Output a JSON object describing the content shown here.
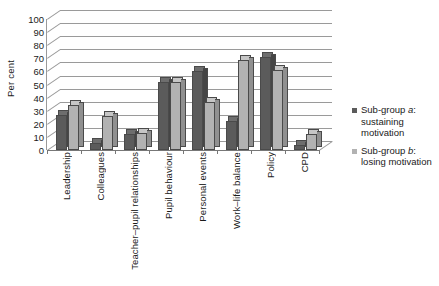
{
  "chart_data": {
    "type": "bar",
    "title": "",
    "xlabel": "",
    "ylabel": "Per cent",
    "ylim": [
      0,
      100
    ],
    "ytick_step": 10,
    "yticks": [
      100,
      90,
      80,
      70,
      60,
      50,
      40,
      30,
      20,
      10,
      0
    ],
    "grid": true,
    "legend_position": "right",
    "style": "3d-perspective-grouped-bars",
    "categories": [
      "Leadership",
      "Colleagues",
      "Teacher–pupil relationships",
      "Pupil behaviour",
      "Personal events",
      "Work–life balance",
      "Policy",
      "CPD"
    ],
    "series": [
      {
        "name": "Sub-group a: sustaining motivation",
        "short_name": "Sub-group a",
        "color": "#5b5b5b",
        "values": [
          27,
          5,
          12,
          52,
          60,
          22,
          71,
          4
        ]
      },
      {
        "name": "Sub-group b: losing motivation",
        "short_name": "Sub-group b",
        "color": "#b2b2b2",
        "values": [
          34,
          26,
          13,
          52,
          37,
          69,
          61,
          12
        ]
      }
    ]
  },
  "legend": {
    "entries": [
      {
        "label_line1_prefix": "Sub-group ",
        "label_line1_italic": "a",
        "label_line1_suffix": ":",
        "label_rest": "sustaining motivation",
        "swatch_color": "#5b5b5b"
      },
      {
        "label_line1_prefix": "Sub-group ",
        "label_line1_italic": "b",
        "label_line1_suffix": ":",
        "label_rest": "losing motivation",
        "swatch_color": "#b2b2b2"
      }
    ]
  },
  "colors": {
    "series_a": "#5b5b5b",
    "series_b": "#b2b2b2",
    "gridline": "#9a9a9a",
    "text": "#1a1a1a",
    "background": "#ffffff"
  }
}
